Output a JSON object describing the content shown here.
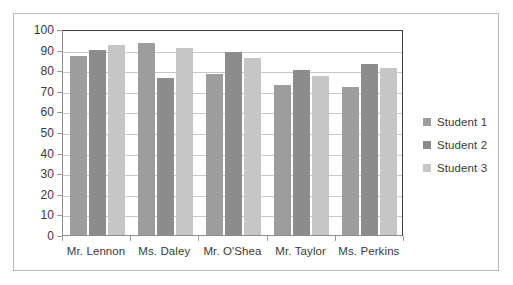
{
  "chart_data": {
    "type": "bar",
    "title": "",
    "subtitle": "",
    "xlabel": "",
    "ylabel": "",
    "ylim": [
      0,
      100
    ],
    "ytick_interval": 10,
    "yticks": [
      "100",
      "90",
      "80",
      "70",
      "60",
      "50",
      "40",
      "30",
      "20",
      "10",
      "0"
    ],
    "grid": true,
    "legend_position": "right",
    "categories": [
      "Mr. Lennon",
      "Ms. Daley",
      "Mr. O'Shea",
      "Mr. Taylor",
      "Ms. Perkins"
    ],
    "series": [
      {
        "name": "Student 1",
        "color": "#9d9d9d",
        "values": [
          87,
          93,
          78,
          73,
          72
        ]
      },
      {
        "name": "Student 2",
        "color": "#8c8c8c",
        "values": [
          90,
          76,
          89,
          80,
          83
        ]
      },
      {
        "name": "Student 3",
        "color": "#c6c6c6",
        "values": [
          92,
          91,
          86,
          77,
          81
        ]
      }
    ]
  },
  "legend": {
    "items": [
      {
        "label": "Student 1",
        "color": "#9d9d9d"
      },
      {
        "label": "Student 2",
        "color": "#8c8c8c"
      },
      {
        "label": "Student 3",
        "color": "#c6c6c6"
      }
    ]
  },
  "colors": {
    "series_1": "#9d9d9d",
    "series_2": "#8c8c8c",
    "series_3": "#c6c6c6",
    "gridline": "#c8c8c8",
    "axis": "#8e8e8e",
    "plot_border": "#3d3d3d",
    "frame_border": "#b9b9b9",
    "text": "#3a3a3a"
  }
}
